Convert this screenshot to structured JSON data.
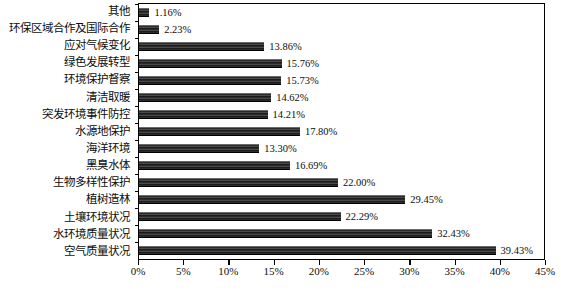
{
  "chart_data": {
    "type": "bar",
    "orientation": "horizontal",
    "title": "",
    "xlabel": "",
    "ylabel": "",
    "xlim": [
      0,
      45
    ],
    "xtick_labels": [
      "0%",
      "5%",
      "10%",
      "15%",
      "20%",
      "25%",
      "30%",
      "35%",
      "40%",
      "45%"
    ],
    "xtick_values": [
      0,
      5,
      10,
      15,
      20,
      25,
      30,
      35,
      40,
      45
    ],
    "grid": false,
    "legend": false,
    "bar_color": "#2e2e2e",
    "categories": [
      "其他",
      "环保区域合作及国际合作",
      "应对气候变化",
      "绿色发展转型",
      "环境保护督察",
      "清洁取暖",
      "突发环境事件防控",
      "水源地保护",
      "海洋环境",
      "黑臭水体",
      "生物多样性保护",
      "植树造林",
      "土壤环境状况",
      "水环境质量状况",
      "空气质量状况"
    ],
    "values": [
      1.16,
      2.23,
      13.86,
      15.76,
      15.73,
      14.62,
      14.21,
      17.8,
      13.3,
      16.69,
      22.0,
      29.45,
      22.29,
      32.43,
      39.43
    ],
    "value_labels": [
      "1.16%",
      "2.23%",
      "13.86%",
      "15.76%",
      "15.73%",
      "14.62%",
      "14.21%",
      "17.80%",
      "13.30%",
      "16.69%",
      "22.00%",
      "29.45%",
      "22.29%",
      "32.43%",
      "39.43%"
    ]
  }
}
